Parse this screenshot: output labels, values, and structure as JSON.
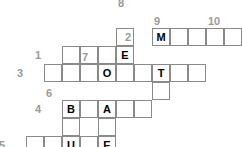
{
  "puzzle": {
    "title": "Crossword Grid",
    "cell_size": 18,
    "grid_origin": {
      "x": 26,
      "y": 10
    },
    "colors": {
      "cell_border": "#8a8a8a",
      "cell_fill": "#ffffff",
      "letter": "#000000",
      "clue_number": "#9a9a9a"
    },
    "clue_numbers": [
      {
        "label": "1",
        "col": 1,
        "row": 2,
        "position": "left"
      },
      {
        "label": "2",
        "col": 6,
        "row": 1,
        "position": "left"
      },
      {
        "label": "3",
        "col": 0,
        "row": 3,
        "position": "left"
      },
      {
        "label": "4",
        "col": 1,
        "row": 5,
        "position": "left"
      },
      {
        "label": "5",
        "col": -1,
        "row": 7,
        "position": "left"
      },
      {
        "label": "6",
        "col": 1,
        "row": 5,
        "position": "above"
      },
      {
        "label": "7",
        "col": 3,
        "row": 3,
        "position": "above"
      },
      {
        "label": "8",
        "col": 5,
        "row": 0,
        "position": "above"
      },
      {
        "label": "9",
        "col": 7,
        "row": 1,
        "position": "above"
      },
      {
        "label": "10",
        "col": 10,
        "row": 1,
        "position": "above"
      }
    ],
    "entries": [
      {
        "name": "across-1",
        "number": "1",
        "direction": "across",
        "col": 2,
        "row": 2,
        "letters": [
          "",
          "",
          "",
          "E"
        ]
      },
      {
        "name": "across-2",
        "number": "2",
        "direction": "across",
        "col": 7,
        "row": 1,
        "letters": [
          "M",
          "",
          "",
          "",
          "",
          "N"
        ]
      },
      {
        "name": "across-3",
        "number": "3",
        "direction": "across",
        "col": 1,
        "row": 3,
        "letters": [
          "",
          "",
          "O",
          "",
          "",
          "T"
        ]
      },
      {
        "name": "across-4",
        "number": "4",
        "direction": "across",
        "col": 2,
        "row": 5,
        "letters": [
          "B",
          "",
          "A",
          "",
          ""
        ]
      },
      {
        "name": "across-5",
        "number": "5",
        "direction": "across",
        "col": 0,
        "row": 7,
        "letters": [
          "",
          "",
          "U",
          "",
          "E"
        ]
      },
      {
        "name": "across-9b",
        "number": "",
        "direction": "across",
        "col": 7,
        "row": 3,
        "letters": [
          "U",
          "",
          ""
        ]
      },
      {
        "name": "down-6",
        "number": "6",
        "direction": "down",
        "col": 2,
        "row": 5,
        "letters": [
          "B",
          "",
          "U"
        ]
      },
      {
        "name": "down-7",
        "number": "7",
        "direction": "down",
        "col": 4,
        "row": 3,
        "letters": [
          "O",
          "A",
          "",
          "E"
        ]
      },
      {
        "name": "down-8",
        "number": "8",
        "direction": "down",
        "col": 5,
        "row": 1,
        "letters": [
          "",
          "E",
          "T"
        ]
      },
      {
        "name": "down-9",
        "number": "9",
        "direction": "down",
        "col": 7,
        "row": 1,
        "letters": [
          "M",
          "U",
          ""
        ]
      },
      {
        "name": "down-10",
        "number": "10",
        "direction": "down",
        "col": 12,
        "row": 1,
        "letters": [
          "N",
          "",
          "",
          ""
        ]
      }
    ],
    "cells": [
      {
        "name": "cell-c5r1",
        "col": 5,
        "row": 1,
        "letter": ""
      },
      {
        "name": "cell-c2r2",
        "col": 2,
        "row": 2,
        "letter": ""
      },
      {
        "name": "cell-c3r2",
        "col": 3,
        "row": 2,
        "letter": ""
      },
      {
        "name": "cell-c4r2",
        "col": 4,
        "row": 2,
        "letter": ""
      },
      {
        "name": "cell-c5r2",
        "col": 5,
        "row": 2,
        "letter": "E"
      },
      {
        "name": "cell-c1r3",
        "col": 1,
        "row": 3,
        "letter": ""
      },
      {
        "name": "cell-c2r3",
        "col": 2,
        "row": 3,
        "letter": ""
      },
      {
        "name": "cell-c3r3",
        "col": 3,
        "row": 3,
        "letter": ""
      },
      {
        "name": "cell-c4r3",
        "col": 4,
        "row": 3,
        "letter": "O"
      },
      {
        "name": "cell-c5r3-b",
        "col": 5,
        "row": 3,
        "letter": ""
      },
      {
        "name": "cell-c6r3",
        "col": 6,
        "row": 3,
        "letter": ""
      },
      {
        "name": "cell-c7r3",
        "col": 7,
        "row": 3,
        "letter": "T"
      },
      {
        "name": "cell-c2r5",
        "col": 2,
        "row": 5,
        "letter": "B"
      },
      {
        "name": "cell-c3r5",
        "col": 3,
        "row": 5,
        "letter": ""
      },
      {
        "name": "cell-c4r5",
        "col": 4,
        "row": 5,
        "letter": "A"
      },
      {
        "name": "cell-c5r5",
        "col": 5,
        "row": 5,
        "letter": ""
      },
      {
        "name": "cell-c6r5",
        "col": 6,
        "row": 5,
        "letter": ""
      },
      {
        "name": "cell-c2r6",
        "col": 2,
        "row": 6,
        "letter": ""
      },
      {
        "name": "cell-c4r6",
        "col": 4,
        "row": 6,
        "letter": ""
      },
      {
        "name": "cell-c0r7",
        "col": 0,
        "row": 7,
        "letter": ""
      },
      {
        "name": "cell-c1r7",
        "col": 1,
        "row": 7,
        "letter": ""
      },
      {
        "name": "cell-c2r7",
        "col": 2,
        "row": 7,
        "letter": "U"
      },
      {
        "name": "cell-c3r7",
        "col": 3,
        "row": 7,
        "letter": ""
      },
      {
        "name": "cell-c4r7",
        "col": 4,
        "row": 7,
        "letter": "E"
      },
      {
        "name": "cell-c7r1",
        "col": 7,
        "row": 1,
        "letter": "M"
      },
      {
        "name": "cell-c8r1",
        "col": 8,
        "row": 1,
        "letter": ""
      },
      {
        "name": "cell-c9r1",
        "col": 9,
        "row": 1,
        "letter": ""
      },
      {
        "name": "cell-c10r1",
        "col": 10,
        "row": 1,
        "letter": ""
      },
      {
        "name": "cell-c11r1",
        "col": 11,
        "row": 1,
        "letter": ""
      },
      {
        "name": "cell-c12r1",
        "col": 12,
        "row": 1,
        "letter": "N"
      },
      {
        "name": "cell-c7r3-u",
        "col": 7,
        "row": 3,
        "letter": "U"
      },
      {
        "name": "cell-c8r3",
        "col": 8,
        "row": 3,
        "letter": ""
      },
      {
        "name": "cell-c9r3",
        "col": 9,
        "row": 3,
        "letter": ""
      },
      {
        "name": "cell-c7r4",
        "col": 7,
        "row": 4,
        "letter": ""
      },
      {
        "name": "cell-c12r2",
        "col": 12,
        "row": 2,
        "letter": ""
      },
      {
        "name": "cell-c12r3",
        "col": 12,
        "row": 3,
        "letter": ""
      },
      {
        "name": "cell-c12r4",
        "col": 12,
        "row": 4,
        "letter": ""
      }
    ]
  }
}
